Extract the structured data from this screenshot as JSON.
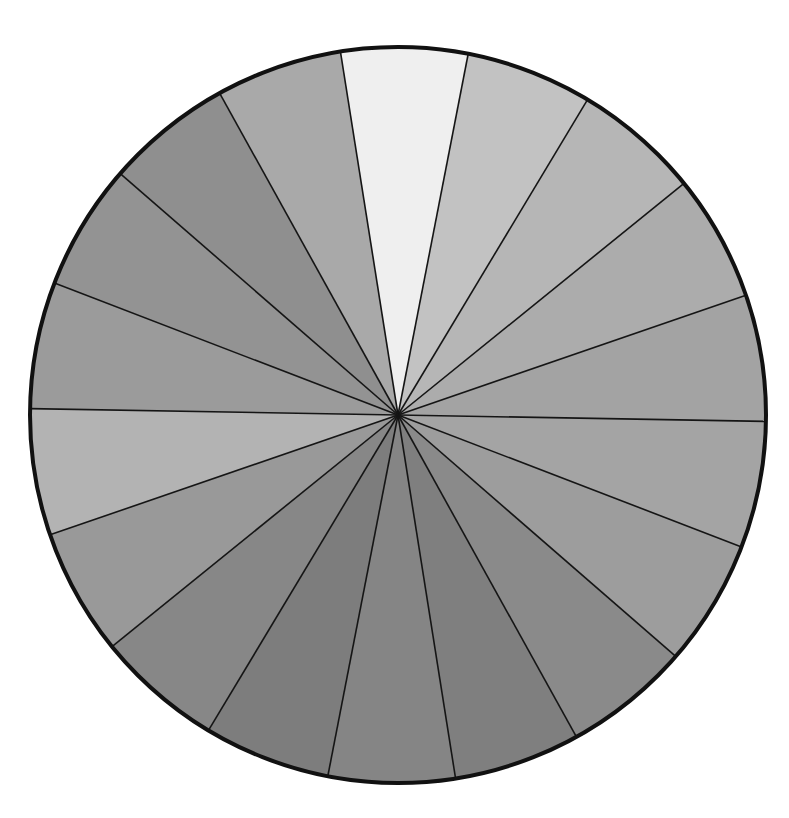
{
  "figure": {
    "center": [
      398,
      415
    ],
    "radius": 368,
    "outline_color": "#111111",
    "divider_color": "#151515",
    "start_angle_deg": -9,
    "wedges": [
      {
        "index": 1,
        "fill": "#efefef"
      },
      {
        "index": 2,
        "fill": "#c2c2c2"
      },
      {
        "index": 3,
        "fill": "#b6b6b6"
      },
      {
        "index": 4,
        "fill": "#acacac"
      },
      {
        "index": 5,
        "fill": "#a3a3a3"
      },
      {
        "index": 6,
        "fill": "#a4a4a4"
      },
      {
        "index": 7,
        "fill": "#9d9d9d"
      },
      {
        "index": 8,
        "fill": "#8a8a8a"
      },
      {
        "index": 9,
        "fill": "#7f7f7f"
      },
      {
        "index": 10,
        "fill": "#858585"
      },
      {
        "index": 11,
        "fill": "#7d7d7d"
      },
      {
        "index": 12,
        "fill": "#878787"
      },
      {
        "index": 13,
        "fill": "#999999"
      },
      {
        "index": 14,
        "fill": "#b3b3b3"
      },
      {
        "index": 15,
        "fill": "#9b9b9b"
      },
      {
        "index": 16,
        "fill": "#939393"
      },
      {
        "index": 17,
        "fill": "#8f8f8f"
      },
      {
        "index": 18,
        "fill": "#a9a9a9"
      }
    ]
  }
}
